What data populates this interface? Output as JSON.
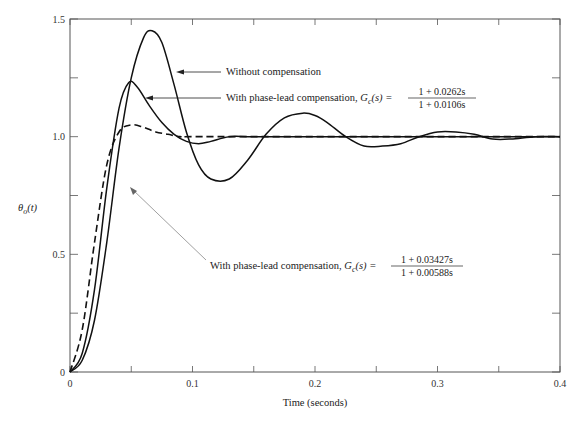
{
  "chart_data": {
    "type": "line",
    "title": "",
    "xlabel": "Time (seconds)",
    "ylabel": "θo(t)",
    "xlim": [
      0,
      0.4
    ],
    "ylim": [
      0,
      1.5
    ],
    "x_ticks": [
      0,
      0.1,
      0.2,
      0.3,
      0.4
    ],
    "x_tick_labels": [
      "0",
      "0.1",
      "0.2",
      "0.3",
      "0.4"
    ],
    "y_ticks": [
      0,
      0.5,
      1.0,
      1.5
    ],
    "y_tick_labels": [
      "0",
      "0.5",
      "1.0",
      "1.5"
    ],
    "x_minor_ticks": [
      0.05,
      0.15,
      0.25,
      0.35
    ],
    "y_minor_ticks": [
      0.25,
      0.75,
      1.25
    ],
    "grid": false,
    "series": [
      {
        "name": "Without compensation",
        "style": "solid",
        "x": [
          0,
          0.01,
          0.02,
          0.03,
          0.04,
          0.05,
          0.06,
          0.067,
          0.075,
          0.085,
          0.095,
          0.105,
          0.115,
          0.13,
          0.145,
          0.16,
          0.175,
          0.19,
          0.2,
          0.21,
          0.225,
          0.24,
          0.255,
          0.27,
          0.285,
          0.3,
          0.315,
          0.33,
          0.345,
          0.36,
          0.38,
          0.4
        ],
        "y": [
          0,
          0.05,
          0.22,
          0.55,
          0.95,
          1.25,
          1.42,
          1.45,
          1.4,
          1.22,
          1.02,
          0.88,
          0.82,
          0.82,
          0.9,
          1.01,
          1.08,
          1.1,
          1.09,
          1.06,
          1.0,
          0.96,
          0.96,
          0.97,
          1.0,
          1.02,
          1.02,
          1.01,
          0.99,
          0.99,
          1.0,
          1.0
        ]
      },
      {
        "name": "With phase-lead compensation, Gc(s) = (1 + 0.0262s)/(1 + 0.0106s)",
        "style": "solid",
        "x": [
          0,
          0.01,
          0.02,
          0.03,
          0.04,
          0.048,
          0.055,
          0.065,
          0.075,
          0.085,
          0.095,
          0.105,
          0.115,
          0.13,
          0.15,
          0.2,
          0.3,
          0.4
        ],
        "y": [
          0,
          0.08,
          0.35,
          0.78,
          1.12,
          1.23,
          1.21,
          1.13,
          1.06,
          1.01,
          0.98,
          0.97,
          0.98,
          1.0,
          1.0,
          1.0,
          1.0,
          1.0
        ]
      },
      {
        "name": "With phase-lead compensation, Gc(s) = (1 + 0.03427s)/(1 + 0.00588s)",
        "style": "dashed",
        "x": [
          0,
          0.01,
          0.02,
          0.03,
          0.04,
          0.05,
          0.06,
          0.07,
          0.08,
          0.09,
          0.1,
          0.2,
          0.3,
          0.4
        ],
        "y": [
          0,
          0.18,
          0.55,
          0.88,
          1.02,
          1.05,
          1.04,
          1.02,
          1.01,
          1.0,
          1.0,
          1.0,
          1.0,
          1.0
        ]
      }
    ],
    "annotations": [
      {
        "text": "Without compensation",
        "arrow_to": [
          0.07,
          1.3
        ]
      },
      {
        "text": "With phase-lead compensation,",
        "formula_lhs": "Gc(s) =",
        "numerator": "1 + 0.0262s",
        "denominator": "1 + 0.0106s",
        "arrow_to": [
          0.055,
          1.2
        ]
      },
      {
        "text": "With phase-lead compensation,",
        "formula_lhs": "Gc(s) =",
        "numerator": "1 + 0.03427s",
        "denominator": "1 + 0.00588s",
        "arrow_to": [
          0.05,
          1.04
        ]
      }
    ]
  },
  "labels": {
    "xlabel": "Time (seconds)",
    "ylabel_main": "θ",
    "ylabel_sub": "o",
    "ylabel_arg": "(t)",
    "ann1": "Without compensation",
    "ann2_text": "With phase-lead compensation, ",
    "ann2_G": "G",
    "ann2_Gsub": "c",
    "ann2_eq": "(s) =",
    "ann2_num": "1 + 0.0262s",
    "ann2_den": "1 + 0.0106s",
    "ann3_text": "With phase-lead compensation, ",
    "ann3_G": "G",
    "ann3_Gsub": "c",
    "ann3_eq": "(s) =",
    "ann3_num": "1 + 0.03427s",
    "ann3_den": "1 + 0.00588s"
  },
  "colors": {
    "axis": "#555555",
    "curve": "#111111",
    "leader": "#888888"
  }
}
